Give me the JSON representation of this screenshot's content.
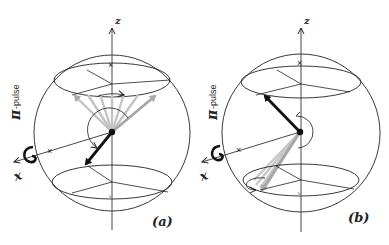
{
  "figure": {
    "panels": [
      {
        "id": "a",
        "label": "(a)",
        "axis_z_label": "z",
        "axis_x_label": "x",
        "pulse_label_symbol": "π",
        "pulse_label_text": "-pulse",
        "description": "Bloch sphere: spin vector pointing down-left into lower cone after π-pulse about x; grey fan of precessing vectors in upper cone"
      },
      {
        "id": "b",
        "label": "(b)",
        "axis_z_label": "z",
        "axis_x_label": "x",
        "pulse_label_symbol": "π",
        "pulse_label_text": "-pulse",
        "description": "Bloch sphere: spin vector pointing up-left in upper cone; grey fan of vectors in lower cone after π-pulse"
      }
    ],
    "colors": {
      "line": "#222222",
      "fan": "#bdbdbd",
      "vector": "#111111",
      "background": "#ffffff"
    }
  }
}
